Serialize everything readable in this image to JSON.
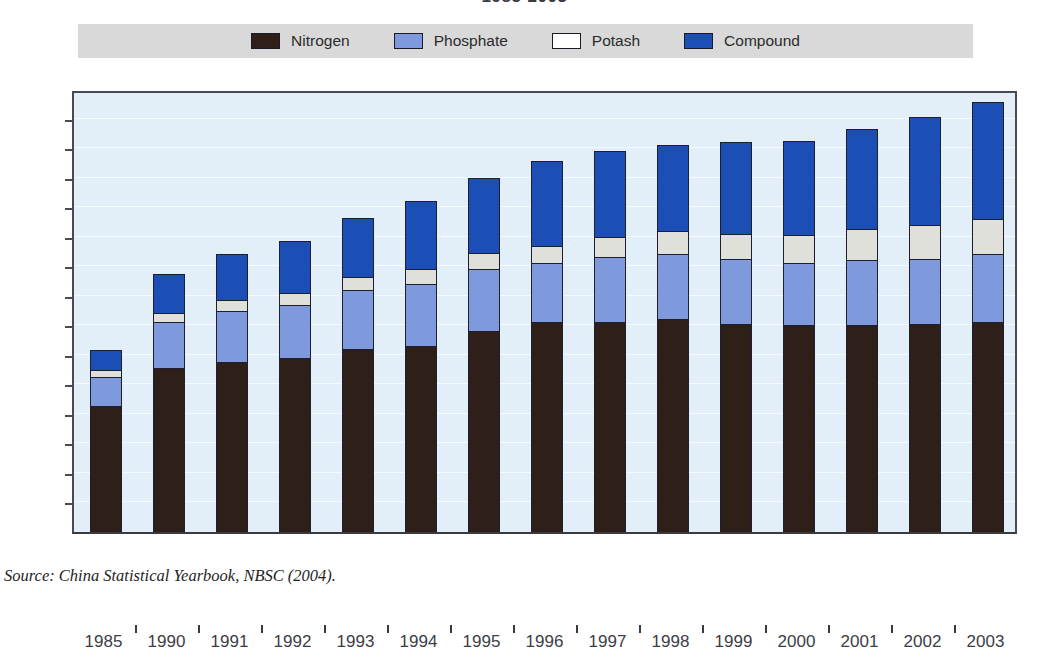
{
  "chart_title": "1985-2003",
  "legend": {
    "items": [
      {
        "label": "Nitrogen",
        "color": "#2e2018"
      },
      {
        "label": "Phosphate",
        "color": "#7e9add"
      },
      {
        "label": "Potash",
        "color": "#ffffff"
      },
      {
        "label": "Compound",
        "color": "#1c4fb5"
      }
    ]
  },
  "source": "Source:  China Statistical Yearbook, NBSC (2004).",
  "chart_data": {
    "type": "bar",
    "subtype": "stacked-vertical",
    "title": "1985-2003",
    "xlabel": "",
    "ylabel": "",
    "ylim": [
      0,
      300
    ],
    "ytick_step": 20,
    "yticks": [
      0,
      20,
      40,
      60,
      80,
      100,
      120,
      140,
      160,
      180,
      200,
      220,
      240,
      260,
      280,
      300
    ],
    "grid": true,
    "legend_position": "top",
    "plot_background": "#e2eef8",
    "categories": [
      "1985",
      "1990",
      "1991",
      "1992",
      "1993",
      "1994",
      "1995",
      "1996",
      "1997",
      "1998",
      "1999",
      "2000",
      "2001",
      "2002",
      "2003"
    ],
    "series": [
      {
        "name": "Nitrogen",
        "color": "#2e2018",
        "values": [
          85,
          111,
          115,
          118,
          124,
          126,
          136,
          142,
          142,
          144,
          141,
          140,
          140,
          141,
          142
        ]
      },
      {
        "name": "Phosphate",
        "color": "#7e9add",
        "values": [
          20,
          31,
          35,
          36,
          40,
          42,
          42,
          40,
          44,
          44,
          44,
          42,
          44,
          44,
          46
        ]
      },
      {
        "name": "Potash",
        "color": "#e0e0da",
        "values": [
          5,
          6,
          7,
          8,
          9,
          10,
          11,
          12,
          14,
          16,
          17,
          19,
          21,
          23,
          24
        ]
      },
      {
        "name": "Compound",
        "color": "#1c4fb5",
        "values": [
          13,
          27,
          31,
          35,
          40,
          46,
          51,
          57,
          58,
          58,
          62,
          64,
          68,
          73,
          79
        ]
      }
    ],
    "totals": [
      123,
      175,
      188,
      197,
      213,
      224,
      240,
      251,
      258,
      262,
      264,
      265,
      273,
      281,
      291
    ]
  }
}
